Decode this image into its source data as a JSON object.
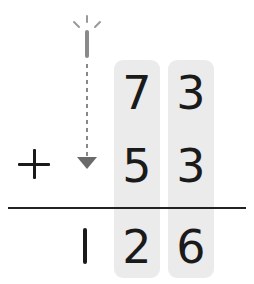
{
  "problem": {
    "operator": "+",
    "addend1": {
      "tens": "7",
      "ones": "3"
    },
    "addend2": {
      "tens": "5",
      "ones": "3"
    },
    "sum": {
      "hundreds": "1",
      "tens": "2",
      "ones": "6"
    }
  },
  "colors": {
    "column_highlight": "#ebebeb",
    "digit": "#1a1a1a",
    "carry_arrow": "#6a6a6a"
  }
}
